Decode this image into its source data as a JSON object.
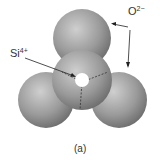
{
  "figure": {
    "caption": "(a)",
    "labels": {
      "oxygen": {
        "symbol": "O",
        "charge": "2−"
      },
      "silicon": {
        "symbol": "Si",
        "charge": "4+"
      }
    },
    "colors": {
      "sphere_light": "#c8c8c8",
      "sphere_dark": "#6e6e6e",
      "arrow": "#222222"
    }
  }
}
